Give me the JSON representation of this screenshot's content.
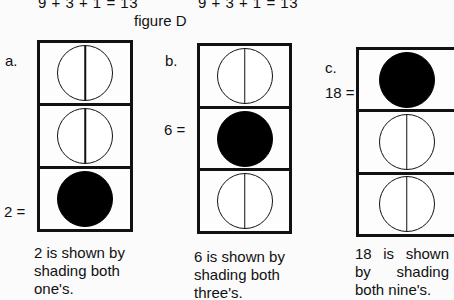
{
  "header": {
    "equation_left": "9 + 3 + 1 = 13",
    "equation_right": "9 + 3 + 1 = 13",
    "figure_caption": "figure D"
  },
  "panels": [
    {
      "label": "a.",
      "value_label": "2 =",
      "value_row": 3,
      "cells": [
        {
          "state": "empty",
          "icon": "divided-circle"
        },
        {
          "state": "empty",
          "icon": "divided-circle"
        },
        {
          "state": "shaded",
          "icon": "filled-circle"
        }
      ],
      "description": [
        "2 is shown by",
        "shading both",
        "one's."
      ]
    },
    {
      "label": "b.",
      "value_label": "6 =",
      "value_row": 2,
      "cells": [
        {
          "state": "empty",
          "icon": "divided-circle"
        },
        {
          "state": "shaded",
          "icon": "filled-circle"
        },
        {
          "state": "empty",
          "icon": "divided-circle"
        }
      ],
      "description": [
        "6 is shown by",
        "shading both",
        "three's."
      ]
    },
    {
      "label": "c.",
      "value_label": "18 =",
      "value_row": 1,
      "cells": [
        {
          "state": "shaded",
          "icon": "filled-circle"
        },
        {
          "state": "empty",
          "icon": "divided-circle"
        },
        {
          "state": "empty",
          "icon": "divided-circle"
        }
      ],
      "description": [
        "18 is shown",
        "by shading",
        "both nine's."
      ]
    }
  ],
  "colors": {
    "ink": "#111111",
    "paper": "#fbfbfb"
  }
}
